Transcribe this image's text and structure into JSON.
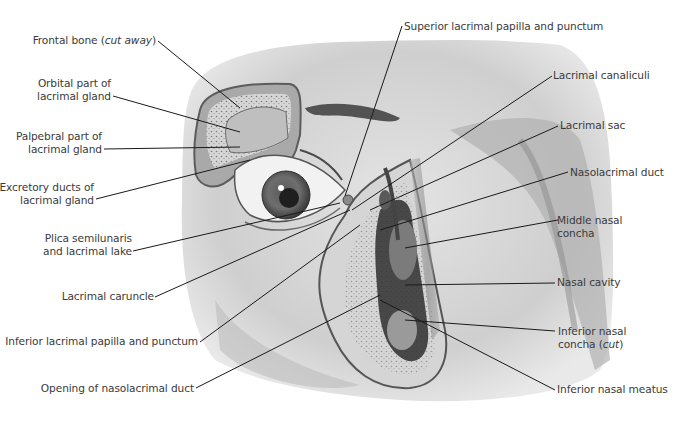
{
  "figure": {
    "type": "anatomical-illustration",
    "colors": {
      "background": "#ffffff",
      "label_text": "#3a3a3a",
      "leader_line": "#1a1a1a",
      "skin": "#c9c9c9",
      "shadow": "#6e6e6e"
    }
  },
  "labels": {
    "left": [
      {
        "id": "frontal-bone",
        "line1": "Frontal bone (",
        "italic": "cut away",
        "line1_end": ")"
      },
      {
        "id": "orbital-part",
        "line1": "Orbital part of",
        "line2": "lacrimal gland"
      },
      {
        "id": "palpebral-part",
        "line1": "Palpebral part of",
        "line2": "lacrimal gland"
      },
      {
        "id": "excretory-ducts",
        "line1": "Excretory ducts of",
        "line2": "lacrimal gland"
      },
      {
        "id": "plica",
        "line1": "Plica semilunaris",
        "line2": "and lacrimal lake"
      },
      {
        "id": "caruncle",
        "line1": "Lacrimal caruncle"
      },
      {
        "id": "inferior-papilla",
        "line1": "Inferior lacrimal papilla and punctum"
      },
      {
        "id": "opening-duct",
        "line1": "Opening of nasolacrimal duct"
      }
    ],
    "top": [
      {
        "id": "superior-papilla",
        "line1": "Superior lacrimal papilla and punctum"
      }
    ],
    "right": [
      {
        "id": "canaliculi",
        "line1": "Lacrimal canaliculi"
      },
      {
        "id": "sac",
        "line1": "Lacrimal sac"
      },
      {
        "id": "nasolacrimal-duct",
        "line1": "Nasolacrimal duct"
      },
      {
        "id": "middle-concha",
        "line1": "Middle nasal",
        "line2": "concha"
      },
      {
        "id": "nasal-cavity",
        "line1": "Nasal cavity"
      },
      {
        "id": "inferior-concha",
        "line1": "Inferior nasal",
        "line2": "concha (",
        "italic": "cut",
        "line2_end": ")"
      },
      {
        "id": "inferior-meatus",
        "line1": "Inferior nasal meatus"
      }
    ]
  }
}
